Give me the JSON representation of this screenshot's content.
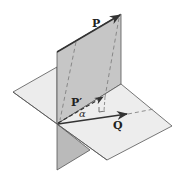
{
  "diagram": {
    "type": "vector projection onto plane",
    "labels": {
      "P": "P",
      "P_prime": "P′",
      "Q": "Q",
      "alpha": "α"
    },
    "colors": {
      "vertical_plane": "#c6c6c6",
      "vertical_plane_lower": "#b9b9b9",
      "horizontal_plane": "#ededed",
      "edge": "#555555",
      "vector": "#333333",
      "dashed": "#777777"
    },
    "elements": [
      "vertical-plane",
      "horizontal-plane",
      "vector-P",
      "vector-P-prime (dashed projection)",
      "vector-Q",
      "angle-alpha",
      "right-angle-marker"
    ]
  }
}
